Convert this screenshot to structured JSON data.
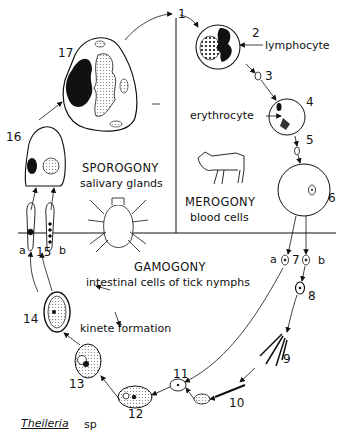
{
  "diagram": {
    "title": "Theileria",
    "title_suffix": "sp",
    "phases": {
      "sporogony": {
        "name": "SPOROGONY",
        "location": "salivary glands"
      },
      "merogony": {
        "name": "MEROGONY",
        "location": "blood cells"
      },
      "gamogony": {
        "name": "GAMOGONY",
        "location": "intestinal cells of tick nymphs"
      }
    },
    "annotations": {
      "lymphocyte": "lymphocyte",
      "erythrocyte": "erythrocyte",
      "kinete_formation": "kinete formation",
      "nucleus": "N"
    },
    "stages": [
      "1",
      "2",
      "3",
      "4",
      "5",
      "6",
      "7",
      "8",
      "9",
      "10",
      "11",
      "12",
      "13",
      "14",
      "15",
      "16",
      "17"
    ],
    "branch_labels": {
      "a": "a",
      "b": "b"
    },
    "colors": {
      "ink": "#111111",
      "stipple": "#cccccc",
      "background": "#ffffff"
    }
  }
}
